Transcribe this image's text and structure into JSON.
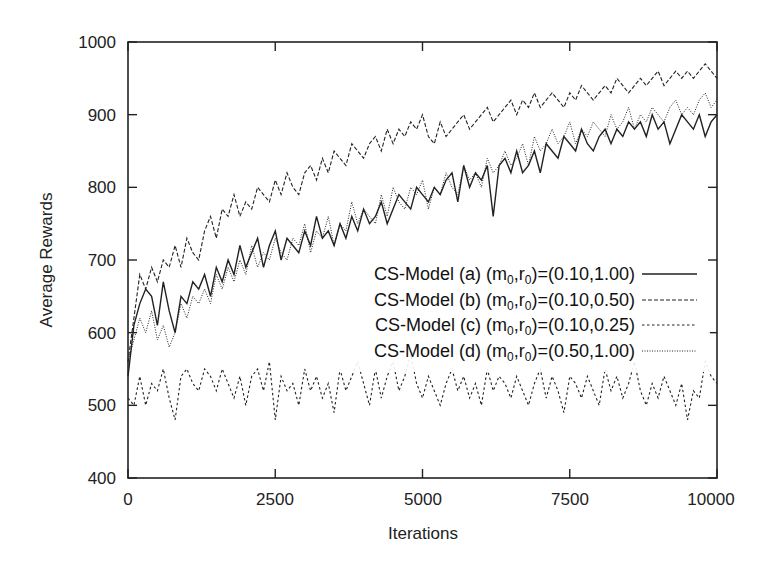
{
  "chart_data": {
    "type": "line",
    "title": "",
    "xlabel": "Iterations",
    "ylabel": "Average Rewards",
    "xlim": [
      0,
      10000
    ],
    "ylim": [
      400,
      1000
    ],
    "x_ticks": [
      0,
      2500,
      5000,
      7500,
      10000
    ],
    "y_ticks": [
      400,
      500,
      600,
      700,
      800,
      900,
      1000
    ],
    "grid": false,
    "legend_position": "inside-lower-right",
    "x": [
      0,
      100,
      200,
      300,
      400,
      500,
      600,
      700,
      800,
      900,
      1000,
      1100,
      1200,
      1300,
      1400,
      1500,
      1600,
      1700,
      1800,
      1900,
      2000,
      2100,
      2200,
      2300,
      2400,
      2500,
      2600,
      2700,
      2800,
      2900,
      3000,
      3100,
      3200,
      3300,
      3400,
      3500,
      3600,
      3700,
      3800,
      3900,
      4000,
      4100,
      4200,
      4300,
      4400,
      4500,
      4600,
      4700,
      4800,
      4900,
      5000,
      5100,
      5200,
      5300,
      5400,
      5500,
      5600,
      5700,
      5800,
      5900,
      6000,
      6100,
      6200,
      6300,
      6400,
      6500,
      6600,
      6700,
      6800,
      6900,
      7000,
      7100,
      7200,
      7300,
      7400,
      7500,
      7600,
      7700,
      7800,
      7900,
      8000,
      8100,
      8200,
      8300,
      8400,
      8500,
      8600,
      8700,
      8800,
      8900,
      9000,
      9100,
      9200,
      9300,
      9400,
      9500,
      9600,
      9700,
      9800,
      9900,
      10000
    ],
    "series": [
      {
        "name": "CS-Model (a) (m0,r0)=(0.10,1.00)",
        "style": "solid",
        "values": [
          540,
          610,
          640,
          660,
          650,
          610,
          670,
          630,
          600,
          650,
          640,
          670,
          660,
          680,
          650,
          690,
          670,
          700,
          680,
          720,
          690,
          710,
          730,
          690,
          720,
          740,
          700,
          730,
          720,
          710,
          740,
          720,
          760,
          730,
          740,
          720,
          750,
          730,
          760,
          740,
          770,
          750,
          760,
          780,
          750,
          770,
          790,
          780,
          770,
          800,
          790,
          780,
          800,
          790,
          810,
          820,
          780,
          830,
          800,
          820,
          810,
          830,
          760,
          830,
          840,
          820,
          850,
          820,
          830,
          850,
          820,
          860,
          850,
          840,
          870,
          860,
          850,
          880,
          860,
          850,
          870,
          880,
          860,
          880,
          870,
          890,
          880,
          890,
          870,
          900,
          880,
          890,
          860,
          880,
          900,
          890,
          880,
          900,
          870,
          890,
          900
        ]
      },
      {
        "name": "CS-Model (b) (m0,r0)=(0.10,0.50)",
        "style": "dashed",
        "values": [
          560,
          620,
          680,
          660,
          690,
          670,
          700,
          690,
          720,
          690,
          730,
          710,
          700,
          740,
          760,
          730,
          770,
          760,
          790,
          760,
          780,
          770,
          800,
          790,
          780,
          810,
          790,
          820,
          800,
          790,
          820,
          830,
          810,
          840,
          820,
          850,
          840,
          830,
          860,
          850,
          840,
          860,
          870,
          850,
          880,
          860,
          880,
          870,
          890,
          880,
          900,
          870,
          860,
          890,
          870,
          880,
          890,
          900,
          880,
          890,
          900,
          910,
          890,
          900,
          910,
          920,
          900,
          920,
          910,
          930,
          910,
          920,
          930,
          920,
          910,
          930,
          920,
          940,
          930,
          920,
          930,
          940,
          930,
          950,
          940,
          930,
          940,
          950,
          940,
          950,
          960,
          940,
          950,
          960,
          950,
          960,
          950,
          960,
          970,
          960,
          950
        ]
      },
      {
        "name": "CS-Model (c) (m0,r0)=(0.10,0.25)",
        "style": "short-dashed",
        "values": [
          510,
          500,
          540,
          500,
          530,
          520,
          550,
          510,
          480,
          540,
          550,
          530,
          520,
          550,
          540,
          520,
          550,
          530,
          510,
          540,
          500,
          540,
          550,
          520,
          560,
          480,
          540,
          520,
          530,
          500,
          550,
          520,
          540,
          510,
          530,
          490,
          550,
          520,
          540,
          560,
          530,
          500,
          550,
          510,
          540,
          560,
          520,
          540,
          570,
          530,
          510,
          540,
          520,
          500,
          530,
          550,
          520,
          540,
          510,
          530,
          500,
          550,
          520,
          540,
          530,
          510,
          540,
          520,
          500,
          530,
          550,
          510,
          540,
          520,
          490,
          540,
          530,
          510,
          540,
          520,
          500,
          550,
          520,
          540,
          510,
          530,
          560,
          520,
          500,
          530,
          510,
          540,
          520,
          500,
          530,
          480,
          520,
          510,
          560,
          540,
          530
        ]
      },
      {
        "name": "CS-Model (d) (m0,r0)=(0.50,1.00)",
        "style": "dotted",
        "values": [
          560,
          590,
          620,
          600,
          630,
          590,
          610,
          580,
          600,
          640,
          620,
          650,
          640,
          660,
          640,
          680,
          660,
          690,
          670,
          700,
          680,
          720,
          690,
          710,
          700,
          730,
          710,
          700,
          730,
          720,
          750,
          710,
          740,
          730,
          760,
          720,
          750,
          740,
          780,
          750,
          770,
          760,
          750,
          790,
          760,
          800,
          780,
          770,
          800,
          790,
          810,
          770,
          800,
          790,
          820,
          800,
          790,
          830,
          810,
          820,
          800,
          840,
          820,
          830,
          850,
          830,
          840,
          860,
          830,
          870,
          850,
          860,
          880,
          860,
          870,
          890,
          860,
          880,
          870,
          890,
          880,
          870,
          900,
          880,
          890,
          910,
          880,
          900,
          890,
          910,
          900,
          890,
          910,
          920,
          900,
          910,
          900,
          920,
          930,
          910,
          920
        ]
      }
    ]
  },
  "axes": {
    "x_label": "Iterations",
    "y_label": "Average Rewards",
    "x_tick_labels": [
      "0",
      "2500",
      "5000",
      "7500",
      "10000"
    ],
    "y_tick_labels": [
      "400",
      "500",
      "600",
      "700",
      "800",
      "900",
      "1000"
    ]
  },
  "legend": {
    "items": [
      {
        "prefix": "CS-Model (a) (m",
        "sub1": "0",
        "mid": ",r",
        "sub2": "0",
        "suffix": ")=(0.10,1.00)",
        "style": "solid"
      },
      {
        "prefix": "CS-Model (b) (m",
        "sub1": "0",
        "mid": ",r",
        "sub2": "0",
        "suffix": ")=(0.10,0.50)",
        "style": "dashed"
      },
      {
        "prefix": "CS-Model (c) (m",
        "sub1": "0",
        "mid": ",r",
        "sub2": "0",
        "suffix": ")=(0.10,0.25)",
        "style": "short-dashed"
      },
      {
        "prefix": "CS-Model (d) (m",
        "sub1": "0",
        "mid": ",r",
        "sub2": "0",
        "suffix": ")=(0.50,1.00)",
        "style": "dotted"
      }
    ]
  },
  "colors": {
    "line": "#222222",
    "frame": "#222222",
    "background": "#ffffff"
  }
}
